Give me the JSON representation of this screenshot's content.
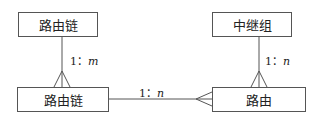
{
  "entities": [
    {
      "id": "route-chain-top",
      "label": "路由链"
    },
    {
      "id": "route-chain-bottom",
      "label": "路由链"
    },
    {
      "id": "relay-group",
      "label": "中继组"
    },
    {
      "id": "route",
      "label": "路由"
    }
  ],
  "relationships": [
    {
      "from": "路由链",
      "to": "路由链",
      "cardinality_one": "1",
      "sep": "：",
      "cardinality_many": "m"
    },
    {
      "from": "路由链",
      "to": "路由",
      "cardinality_one": "1",
      "sep": "：",
      "cardinality_many": "n"
    },
    {
      "from": "中继组",
      "to": "路由",
      "cardinality_one": "1",
      "sep": "：",
      "cardinality_many": "n"
    }
  ]
}
